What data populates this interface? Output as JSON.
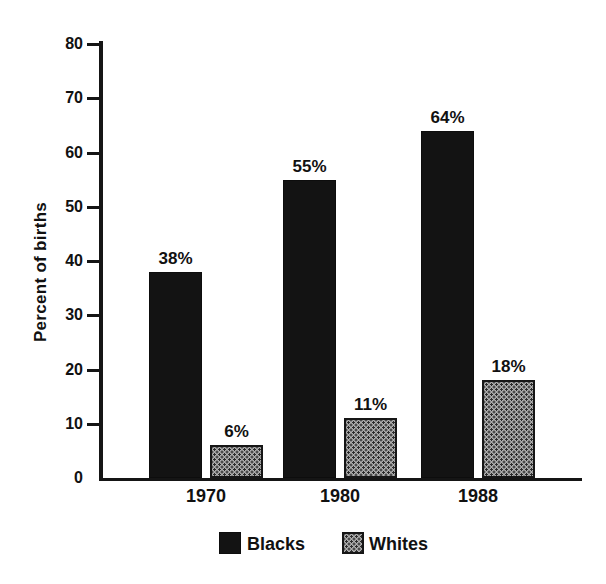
{
  "chart_data": {
    "type": "bar",
    "ylabel": "Percent of births",
    "categories": [
      "1970",
      "1980",
      "1988"
    ],
    "series": [
      {
        "name": "Blacks",
        "values": [
          38,
          55,
          64
        ],
        "value_labels": [
          "38%",
          "55%",
          "64%"
        ],
        "color": "#131313",
        "pattern": "solid"
      },
      {
        "name": "Whites",
        "values": [
          6,
          11,
          18
        ],
        "value_labels": [
          "6%",
          "11%",
          "18%"
        ],
        "color": "#aeaeae",
        "pattern": "stipple-dots"
      }
    ],
    "y_axis": {
      "min": 0,
      "max": 80,
      "tick_interval": 10,
      "ticks": [
        0,
        10,
        20,
        30,
        40,
        50,
        60,
        70,
        80
      ]
    },
    "legend": {
      "position": "bottom",
      "entries": [
        "Blacks",
        "Whites"
      ]
    },
    "grid": false
  },
  "colors": {
    "background": "#ffffff",
    "axis": "#151515",
    "text": "#111111",
    "bar_blacks": "#131313",
    "bar_whites_fill": "#aeaeae",
    "bar_whites_dot": "#2b2b2b"
  }
}
